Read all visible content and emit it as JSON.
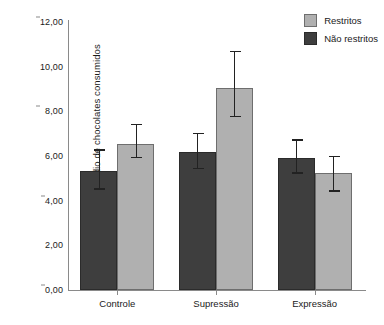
{
  "chart_data": {
    "type": "bar",
    "title": "",
    "xlabel": "",
    "ylabel": "Número médio de chocolates consumidos",
    "categories": [
      "Controle",
      "Supressão",
      "Expressão"
    ],
    "ylim": [
      0,
      12
    ],
    "ytick_values": [
      0,
      2,
      4,
      6,
      8,
      10,
      12
    ],
    "ytick_labels": [
      "0,00",
      "2,00",
      "4,00",
      "6,00",
      "8,00",
      "10,00",
      "12,00"
    ],
    "grid": false,
    "legend_position": "top-right",
    "series": [
      {
        "name": "Não restritos",
        "color": "#3e3e3e",
        "order_in_group": 1,
        "values": [
          5.35,
          6.2,
          5.9
        ],
        "error_upper": [
          6.3,
          7.05,
          6.75
        ],
        "error_lower": [
          4.5,
          5.4,
          5.2
        ]
      },
      {
        "name": "Restritos",
        "color": "#b0b0b0",
        "order_in_group": 2,
        "values": [
          6.55,
          9.05,
          5.25
        ],
        "error_upper": [
          7.45,
          10.7,
          6.0
        ],
        "error_lower": [
          5.9,
          7.75,
          4.4
        ]
      }
    ]
  },
  "legend": {
    "items": [
      {
        "label": "Restritos",
        "color": "#b0b0b0"
      },
      {
        "label": "Não restritos",
        "color": "#3e3e3e"
      }
    ]
  }
}
